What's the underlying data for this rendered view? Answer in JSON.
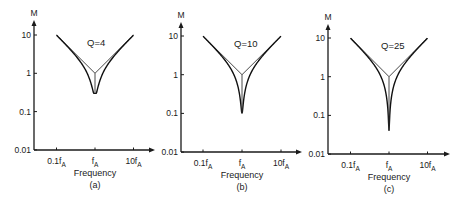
{
  "chart_data": [
    {
      "type": "line",
      "panel": "(a)",
      "annotation": "Q=4",
      "ylabel": "M",
      "xlabel": "Frequency",
      "yscale": "log",
      "xscale": "log",
      "ylim": [
        0.01,
        10
      ],
      "yticks": [
        "10",
        "1",
        "0.1",
        "0.01"
      ],
      "xticks": [
        "0.1fA",
        "fA",
        "10fA"
      ],
      "Q": 4,
      "asymptote": {
        "x": [
          0.1,
          1,
          10
        ],
        "y": [
          10,
          1,
          10
        ]
      },
      "notch_min": 0.3
    },
    {
      "type": "line",
      "panel": "(b)",
      "annotation": "Q=10",
      "ylabel": "M",
      "xlabel": "Frequency",
      "yscale": "log",
      "xscale": "log",
      "ylim": [
        0.01,
        10
      ],
      "yticks": [
        "10",
        "1",
        "0.1",
        "0.01"
      ],
      "xticks": [
        "0.1fA",
        "fA",
        "10fA"
      ],
      "Q": 10,
      "asymptote": {
        "x": [
          0.1,
          1,
          10
        ],
        "y": [
          10,
          1,
          10
        ]
      },
      "notch_min": 0.1
    },
    {
      "type": "line",
      "panel": "(c)",
      "annotation": "Q=25",
      "ylabel": "M",
      "xlabel": "Frequency",
      "yscale": "log",
      "xscale": "log",
      "ylim": [
        0.01,
        10
      ],
      "yticks": [
        "10",
        "1",
        "0.1",
        "0.01"
      ],
      "xticks": [
        "0.1fA",
        "fA",
        "10fA"
      ],
      "Q": 25,
      "asymptote": {
        "x": [
          0.1,
          1,
          10
        ],
        "y": [
          10,
          1,
          10
        ]
      },
      "notch_min": 0.04
    }
  ],
  "layout": {
    "panels": [
      {
        "ax_x": 34,
        "ax_y": 150,
        "y10": 35,
        "decade": 38.3,
        "xc": 95,
        "xdec": 38.5,
        "x_end": 155,
        "y_top": 20
      },
      {
        "ax_x": 181,
        "ax_y": 152,
        "y10": 36,
        "decade": 38.7,
        "xc": 242,
        "xdec": 39,
        "x_end": 302,
        "y_top": 22
      },
      {
        "ax_x": 328,
        "ax_y": 154,
        "y10": 38,
        "decade": 38.7,
        "xc": 389,
        "xdec": 38.5,
        "x_end": 450,
        "y_top": 24
      }
    ]
  }
}
